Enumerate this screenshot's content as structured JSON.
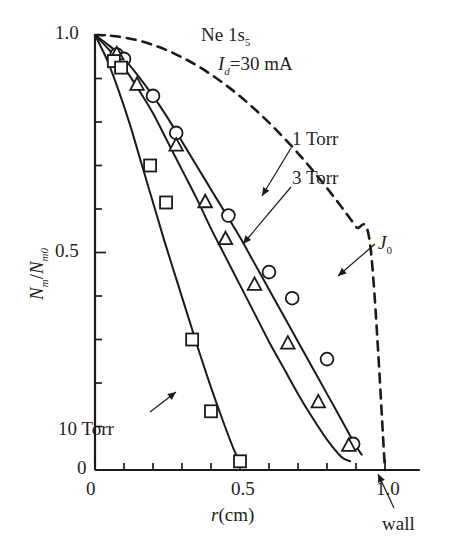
{
  "figure": {
    "title_species": "Ne 1s",
    "title_species_sub": "5",
    "current_symbol": "I",
    "current_symbol_sub": "d",
    "current_value": "=30 mA",
    "wall_label": "wall",
    "background": "#ffffff",
    "line_color": "#1a1a1a"
  },
  "axes": {
    "x": {
      "label_symbol": "r",
      "label_unit": "(cm)",
      "ticks": [
        "0",
        "0.5",
        "1.0"
      ],
      "tick_values": [
        0,
        0.5,
        1.0
      ],
      "minor_step": 0.1,
      "min": 0,
      "max": 1.12
    },
    "y": {
      "label_num": "N",
      "label_num_sub": "m",
      "label_den": "N",
      "label_den_sub": "m0",
      "label_sep": "/",
      "ticks": [
        "0",
        "0.5",
        "1.0"
      ],
      "tick_values": [
        0,
        0.5,
        1.0
      ],
      "minor_step": 0.1,
      "min": 0,
      "max": 1.0
    }
  },
  "annotations": {
    "torr1": "1 Torr",
    "torr3": "3 Torr",
    "torr10": "10 Torr",
    "j0_symbol": "J",
    "j0_sub": "0"
  },
  "chart_data": {
    "type": "line",
    "xlabel": "r (cm)",
    "ylabel": "Nm/Nm0",
    "xlim": [
      0,
      1.12
    ],
    "ylim": [
      0,
      1.0
    ],
    "grid": false,
    "legend": "inline-annotations",
    "series": [
      {
        "name": "1 Torr",
        "marker": "circle",
        "linestyle": "solid",
        "curve_x": [
          0.0,
          0.05,
          0.1,
          0.15,
          0.2,
          0.25,
          0.3,
          0.35,
          0.4,
          0.45,
          0.5,
          0.55,
          0.6,
          0.65,
          0.7,
          0.75,
          0.8,
          0.85,
          0.9,
          0.92
        ],
        "curve_y": [
          1.0,
          0.975,
          0.945,
          0.905,
          0.86,
          0.81,
          0.755,
          0.7,
          0.645,
          0.59,
          0.535,
          0.475,
          0.415,
          0.355,
          0.295,
          0.235,
          0.175,
          0.115,
          0.055,
          0.035
        ],
        "points_x": [
          0.075,
          0.1,
          0.2,
          0.28,
          0.46,
          0.6,
          0.68,
          0.8,
          0.89
        ],
        "points_y": [
          0.955,
          0.945,
          0.86,
          0.775,
          0.585,
          0.455,
          0.395,
          0.255,
          0.06
        ]
      },
      {
        "name": "3 Torr",
        "marker": "triangle",
        "linestyle": "solid",
        "curve_x": [
          0.0,
          0.05,
          0.1,
          0.15,
          0.2,
          0.25,
          0.3,
          0.35,
          0.4,
          0.45,
          0.5,
          0.55,
          0.6,
          0.65,
          0.7,
          0.75,
          0.8,
          0.85,
          0.88
        ],
        "curve_y": [
          1.0,
          0.965,
          0.925,
          0.875,
          0.82,
          0.755,
          0.69,
          0.625,
          0.555,
          0.49,
          0.425,
          0.36,
          0.295,
          0.235,
          0.175,
          0.12,
          0.07,
          0.03,
          0.02
        ],
        "points_x": [
          0.075,
          0.145,
          0.28,
          0.38,
          0.45,
          0.55,
          0.665,
          0.77,
          0.875
        ],
        "points_y": [
          0.955,
          0.885,
          0.745,
          0.615,
          0.53,
          0.425,
          0.29,
          0.155,
          0.055
        ]
      },
      {
        "name": "10 Torr",
        "marker": "square",
        "linestyle": "solid",
        "curve_x": [
          0.0,
          0.04,
          0.08,
          0.12,
          0.16,
          0.2,
          0.24,
          0.28,
          0.32,
          0.36,
          0.4,
          0.44,
          0.48,
          0.5
        ],
        "curve_y": [
          1.0,
          0.945,
          0.875,
          0.795,
          0.705,
          0.615,
          0.525,
          0.44,
          0.355,
          0.27,
          0.19,
          0.115,
          0.045,
          0.02
        ],
        "points_x": [
          0.065,
          0.09,
          0.19,
          0.245,
          0.335,
          0.4,
          0.5
        ],
        "points_y": [
          0.94,
          0.925,
          0.7,
          0.615,
          0.3,
          0.135,
          0.02
        ]
      },
      {
        "name": "J0",
        "marker": "none",
        "linestyle": "dashed",
        "curve_x": [
          0.0,
          0.05,
          0.1,
          0.15,
          0.2,
          0.25,
          0.3,
          0.35,
          0.4,
          0.45,
          0.5,
          0.55,
          0.6,
          0.65,
          0.7,
          0.75,
          0.8,
          0.85,
          0.9,
          0.95,
          1.0
        ],
        "curve_y": [
          1.0,
          0.9986,
          0.9943,
          0.9872,
          0.9772,
          0.9644,
          0.9487,
          0.9304,
          0.9093,
          0.8855,
          0.8591,
          0.8301,
          0.7986,
          0.7645,
          0.7281,
          0.6892,
          0.6481,
          0.6048,
          0.5593,
          0.5118,
          0.0
        ]
      }
    ]
  }
}
